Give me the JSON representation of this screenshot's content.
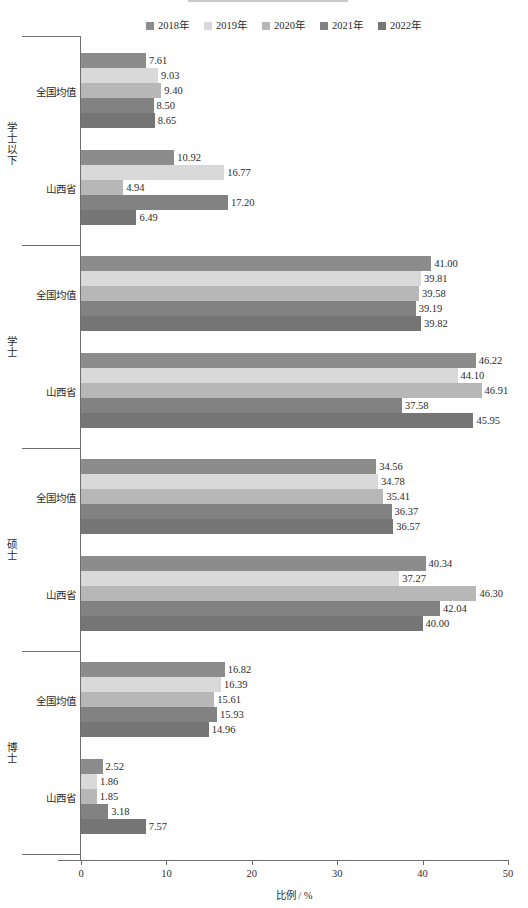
{
  "legend": {
    "items": [
      {
        "label": "2018年",
        "color": "#8c8c8c"
      },
      {
        "label": "2019年",
        "color": "#d9d9d9"
      },
      {
        "label": "2020年",
        "color": "#b7b7b7"
      },
      {
        "label": "2021年",
        "color": "#828282"
      },
      {
        "label": "2022年",
        "color": "#757575"
      }
    ]
  },
  "axis": {
    "x_title": "比例 / %",
    "x_ticks": [
      "0",
      "10",
      "20",
      "30",
      "40",
      "50"
    ]
  },
  "subgroup_labels": {
    "national": "全国均值",
    "province": "山西省"
  },
  "chart_data": {
    "type": "bar",
    "orientation": "horizontal",
    "title": "",
    "xlabel": "比例 / %",
    "ylabel": "",
    "xlim": [
      0,
      50
    ],
    "xticks": [
      0,
      10,
      20,
      30,
      40,
      50
    ],
    "grid": false,
    "legend_position": "top",
    "series": [
      {
        "name": "2018年",
        "color": "#8c8c8c"
      },
      {
        "name": "2019年",
        "color": "#d9d9d9"
      },
      {
        "name": "2020年",
        "color": "#b7b7b7"
      },
      {
        "name": "2021年",
        "color": "#828282"
      },
      {
        "name": "2022年",
        "color": "#757575"
      }
    ],
    "groups": [
      {
        "group_label": "学士以下",
        "subgroups": [
          {
            "label": "全国均值",
            "values": [
              7.61,
              9.03,
              9.4,
              8.5,
              8.65
            ],
            "value_labels": [
              "7.61",
              "9.03",
              "9.40",
              "8.50",
              "8.65"
            ]
          },
          {
            "label": "山西省",
            "values": [
              10.92,
              16.77,
              4.94,
              17.2,
              6.49
            ],
            "value_labels": [
              "10.92",
              "16.77",
              "4.94",
              "17.20",
              "6.49"
            ]
          }
        ]
      },
      {
        "group_label": "学士",
        "subgroups": [
          {
            "label": "全国均值",
            "values": [
              41.0,
              39.81,
              39.58,
              39.19,
              39.82
            ],
            "value_labels": [
              "41.00",
              "39.81",
              "39.58",
              "39.19",
              "39.82"
            ]
          },
          {
            "label": "山西省",
            "values": [
              46.22,
              44.1,
              46.91,
              37.58,
              45.95
            ],
            "value_labels": [
              "46.22",
              "44.10",
              "46.91",
              "37.58",
              "45.95"
            ]
          }
        ]
      },
      {
        "group_label": "硕士",
        "subgroups": [
          {
            "label": "全国均值",
            "values": [
              34.56,
              34.78,
              35.41,
              36.37,
              36.57
            ],
            "value_labels": [
              "34.56",
              "34.78",
              "35.41",
              "36.37",
              "36.57"
            ]
          },
          {
            "label": "山西省",
            "values": [
              40.34,
              37.27,
              46.3,
              42.04,
              40.0
            ],
            "value_labels": [
              "40.34",
              "37.27",
              "46.30",
              "42.04",
              "40.00"
            ]
          }
        ]
      },
      {
        "group_label": "博士",
        "subgroups": [
          {
            "label": "全国均值",
            "values": [
              16.82,
              16.39,
              15.61,
              15.93,
              14.96
            ],
            "value_labels": [
              "16.82",
              "16.39",
              "15.61",
              "15.93",
              "14.96"
            ]
          },
          {
            "label": "山西省",
            "values": [
              2.52,
              1.86,
              1.85,
              3.18,
              7.57
            ],
            "value_labels": [
              "2.52",
              "1.86",
              "1.85",
              "3.18",
              "7.57"
            ]
          }
        ]
      }
    ]
  }
}
